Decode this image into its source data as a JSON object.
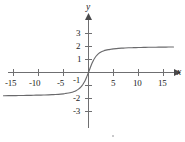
{
  "chart_data": {
    "type": "line",
    "title": "",
    "xlabel": "x",
    "ylabel": "y",
    "xlim": [
      -17,
      17
    ],
    "ylim": [
      -3.6,
      3.6
    ],
    "grid": false,
    "legend": null,
    "x_ticks": [
      -15,
      -10,
      -5,
      5,
      10,
      15
    ],
    "x_tick_labels": [
      "-15",
      "-10",
      "-5",
      "5",
      "10",
      "15"
    ],
    "y_ticks": [
      3,
      2,
      1,
      -1,
      -2,
      -3
    ],
    "y_tick_labels": [
      "3",
      "2",
      "1",
      "-1",
      "-2",
      "-3"
    ],
    "asymptotes": {
      "upper": 2.0,
      "lower": -1.8
    },
    "series": [
      {
        "name": "curve",
        "color": "#6a6a6c",
        "x": [
          -17,
          -16,
          -15,
          -14,
          -13,
          -12,
          -11,
          -10,
          -9,
          -8,
          -7,
          -6,
          -5,
          -4.5,
          -4,
          -3.5,
          -3,
          -2.5,
          -2,
          -1.5,
          -1.2,
          -1,
          -0.8,
          -0.6,
          -0.4,
          -0.2,
          0,
          0.2,
          0.4,
          0.6,
          0.8,
          1,
          1.2,
          1.5,
          2,
          2.5,
          3,
          3.5,
          4,
          4.5,
          5,
          6,
          7,
          8,
          9,
          10,
          11,
          12,
          13,
          14,
          15,
          16,
          17
        ],
        "y": [
          -1.79,
          -1.78,
          -1.78,
          -1.77,
          -1.77,
          -1.76,
          -1.75,
          -1.74,
          -1.73,
          -1.72,
          -1.7,
          -1.68,
          -1.64,
          -1.61,
          -1.58,
          -1.54,
          -1.48,
          -1.4,
          -1.28,
          -1.1,
          -0.96,
          -0.84,
          -0.71,
          -0.55,
          -0.38,
          -0.19,
          0.0,
          0.21,
          0.42,
          0.61,
          0.79,
          0.95,
          1.08,
          1.25,
          1.45,
          1.58,
          1.66,
          1.72,
          1.76,
          1.79,
          1.82,
          1.86,
          1.88,
          1.9,
          1.91,
          1.92,
          1.93,
          1.94,
          1.94,
          1.95,
          1.95,
          1.96,
          1.96
        ]
      }
    ]
  },
  "axis_labels": {
    "x": "x",
    "y": "y"
  },
  "x_tick_labels": {
    "0": "-15",
    "1": "-10",
    "2": "-5",
    "3": "5",
    "4": "10",
    "5": "15"
  },
  "y_tick_labels": {
    "0": "3",
    "1": "2",
    "2": "1",
    "3": "-1",
    "4": "-2",
    "5": "-3"
  }
}
